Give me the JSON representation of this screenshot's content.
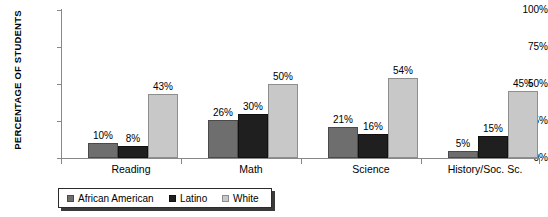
{
  "chart_data": {
    "type": "bar",
    "title": "",
    "xlabel": "",
    "ylabel": "PERCENTAGE OF STUDENTS",
    "ylim": [
      0,
      100
    ],
    "ytick_labels": [
      "0%",
      "25%",
      "50%",
      "75%",
      "100%"
    ],
    "ytick_values": [
      0,
      25,
      50,
      75,
      100
    ],
    "grid": false,
    "legend_position": "bottom-left",
    "categories": [
      "Reading",
      "Math",
      "Science",
      "History/Soc. Sc."
    ],
    "series": [
      {
        "name": "African American",
        "color": "#6e6e6e",
        "values": [
          10,
          26,
          21,
          5
        ],
        "labels": [
          "10%",
          "26%",
          "21%",
          "5%"
        ]
      },
      {
        "name": "Latino",
        "color": "#1f1f1f",
        "values": [
          8,
          30,
          16,
          15
        ],
        "labels": [
          "8%",
          "30%",
          "16%",
          "15%"
        ]
      },
      {
        "name": "White",
        "color": "#c8c8c8",
        "values": [
          43,
          50,
          54,
          45
        ],
        "labels": [
          "43%",
          "50%",
          "54%",
          "45%"
        ]
      }
    ]
  },
  "axis": {
    "y_title": "PERCENTAGE OF STUDENTS",
    "ticks": [
      {
        "label": "100%"
      },
      {
        "label": "75%"
      },
      {
        "label": "50%"
      },
      {
        "label": "25%"
      },
      {
        "label": "0%"
      }
    ]
  },
  "groups": [
    {
      "label": "Reading"
    },
    {
      "label": "Math"
    },
    {
      "label": "Science"
    },
    {
      "label": "History/Soc. Sc."
    }
  ],
  "legend": {
    "items": [
      {
        "label": "African American"
      },
      {
        "label": "Latino"
      },
      {
        "label": "White"
      }
    ]
  },
  "colors": {
    "african_american": "#6e6e6e",
    "latino": "#1f1f1f",
    "white": "#c8c8c8",
    "axis": "#888888",
    "text": "#000000",
    "legend_border": "#2b2b2b",
    "legend_shadow": "#3a3a3a"
  }
}
